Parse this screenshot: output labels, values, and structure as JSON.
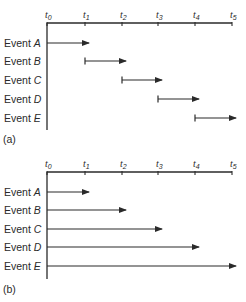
{
  "diagram": {
    "panels": [
      {
        "id": "a",
        "label": "(a)",
        "axis": {
          "ticks": [
            {
              "base": "t",
              "sub": "0"
            },
            {
              "base": "t",
              "sub": "1"
            },
            {
              "base": "t",
              "sub": "2"
            },
            {
              "base": "t",
              "sub": "3"
            },
            {
              "base": "t",
              "sub": "4"
            },
            {
              "base": "t",
              "sub": "5"
            }
          ]
        },
        "events": [
          {
            "prefix": "Event ",
            "name": "A",
            "start": 0,
            "end": 1
          },
          {
            "prefix": "Event ",
            "name": "B",
            "start": 1,
            "end": 2
          },
          {
            "prefix": "Event ",
            "name": "C",
            "start": 2,
            "end": 3
          },
          {
            "prefix": "Event ",
            "name": "D",
            "start": 3,
            "end": 4
          },
          {
            "prefix": "Event ",
            "name": "E",
            "start": 4,
            "end": 5
          }
        ]
      },
      {
        "id": "b",
        "label": "(b)",
        "axis": {
          "ticks": [
            {
              "base": "t",
              "sub": "0"
            },
            {
              "base": "t",
              "sub": "1"
            },
            {
              "base": "t",
              "sub": "2"
            },
            {
              "base": "t",
              "sub": "3"
            },
            {
              "base": "t",
              "sub": "4"
            },
            {
              "base": "t",
              "sub": "5"
            }
          ]
        },
        "events": [
          {
            "prefix": "Event ",
            "name": "A",
            "start": 0,
            "end": 1
          },
          {
            "prefix": "Event ",
            "name": "B",
            "start": 0,
            "end": 2
          },
          {
            "prefix": "Event ",
            "name": "C",
            "start": 0,
            "end": 3
          },
          {
            "prefix": "Event ",
            "name": "D",
            "start": 0,
            "end": 4
          },
          {
            "prefix": "Event ",
            "name": "E",
            "start": 0,
            "end": 5
          }
        ]
      }
    ],
    "colors": {
      "line": "#2a2a2a",
      "background": "#ffffff"
    }
  }
}
